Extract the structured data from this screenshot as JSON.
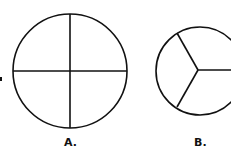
{
  "figures": [
    {
      "label": "A.",
      "shape": "circle",
      "divisions": 4,
      "description": "circle divided into four equal parts"
    },
    {
      "label": "B.",
      "shape": "circle",
      "divisions": 3,
      "description": "circle divided into three equal parts"
    }
  ],
  "colors": {
    "stroke": "#111111",
    "background": "#ffffff"
  }
}
